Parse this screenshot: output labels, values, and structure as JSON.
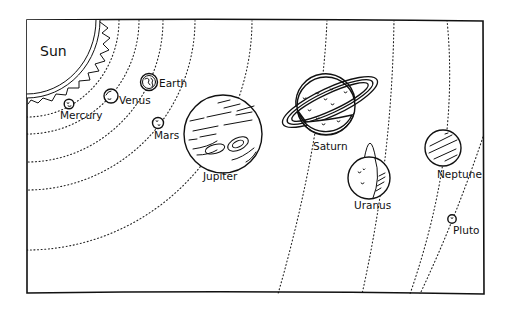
{
  "sun": {
    "label": "Sun"
  },
  "planets": [
    {
      "name": "Mercury",
      "label": "Mercury"
    },
    {
      "name": "Venus",
      "label": "Venus"
    },
    {
      "name": "Earth",
      "label": "Earth"
    },
    {
      "name": "Mars",
      "label": "Mars"
    },
    {
      "name": "Jupiter",
      "label": "Jupiter"
    },
    {
      "name": "Saturn",
      "label": "Saturn"
    },
    {
      "name": "Uranus",
      "label": "Uranus"
    },
    {
      "name": "Neptune",
      "label": "Neptune"
    },
    {
      "name": "Pluto",
      "label": "Pluto"
    }
  ],
  "colors": {
    "ink": "#111111",
    "background": "#ffffff"
  }
}
